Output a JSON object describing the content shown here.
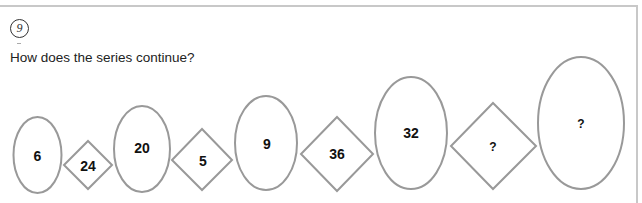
{
  "problem": {
    "number": "9",
    "question": "How does the series continue?"
  },
  "series": [
    {
      "shape": "ellipse",
      "label": "6"
    },
    {
      "shape": "diamond",
      "label": "24"
    },
    {
      "shape": "ellipse",
      "label": "20"
    },
    {
      "shape": "diamond",
      "label": "5"
    },
    {
      "shape": "ellipse",
      "label": "9"
    },
    {
      "shape": "diamond",
      "label": "36"
    },
    {
      "shape": "ellipse",
      "label": "32"
    },
    {
      "shape": "diamond",
      "label": "?"
    },
    {
      "shape": "ellipse",
      "label": "?"
    }
  ],
  "colors": {
    "shape_stroke": "#999999",
    "text": "#111111",
    "frame": "#c8c8c8"
  }
}
